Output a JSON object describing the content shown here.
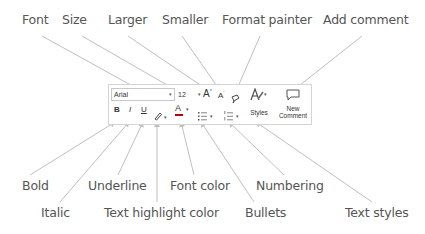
{
  "diagram": {
    "top_labels": [
      {
        "id": "font",
        "text": "Font"
      },
      {
        "id": "size",
        "text": "Size"
      },
      {
        "id": "larger",
        "text": "Larger"
      },
      {
        "id": "smaller",
        "text": "Smaller"
      },
      {
        "id": "format_painter",
        "text": "Format painter"
      },
      {
        "id": "add_comment",
        "text": "Add comment"
      }
    ],
    "bottom_labels": [
      {
        "id": "bold",
        "text": "Bold"
      },
      {
        "id": "underline",
        "text": "Underline"
      },
      {
        "id": "font_color",
        "text": "Font color"
      },
      {
        "id": "numbering",
        "text": "Numbering"
      },
      {
        "id": "italic",
        "text": "Italic"
      },
      {
        "id": "text_highlight_color",
        "text": "Text highlight color"
      },
      {
        "id": "bullets",
        "text": "Bullets"
      },
      {
        "id": "text_styles",
        "text": "Text styles"
      }
    ]
  },
  "toolbar": {
    "font_value": "Arial",
    "size_value": "12",
    "dropdown_glyph": "▾",
    "grow_font": "A",
    "shrink_font": "A",
    "bold": "B",
    "italic": "I",
    "underline": "U",
    "font_color_glyph": "A",
    "styles_label": "Styles",
    "new_comment_line1": "New",
    "new_comment_line2": "Comment",
    "colors": {
      "font_color_bar": "#c00000",
      "highlight_bar": "#ffff00",
      "arrow": "#bfbfbf",
      "label_text": "#555555",
      "border": "#d4d4d4"
    }
  }
}
